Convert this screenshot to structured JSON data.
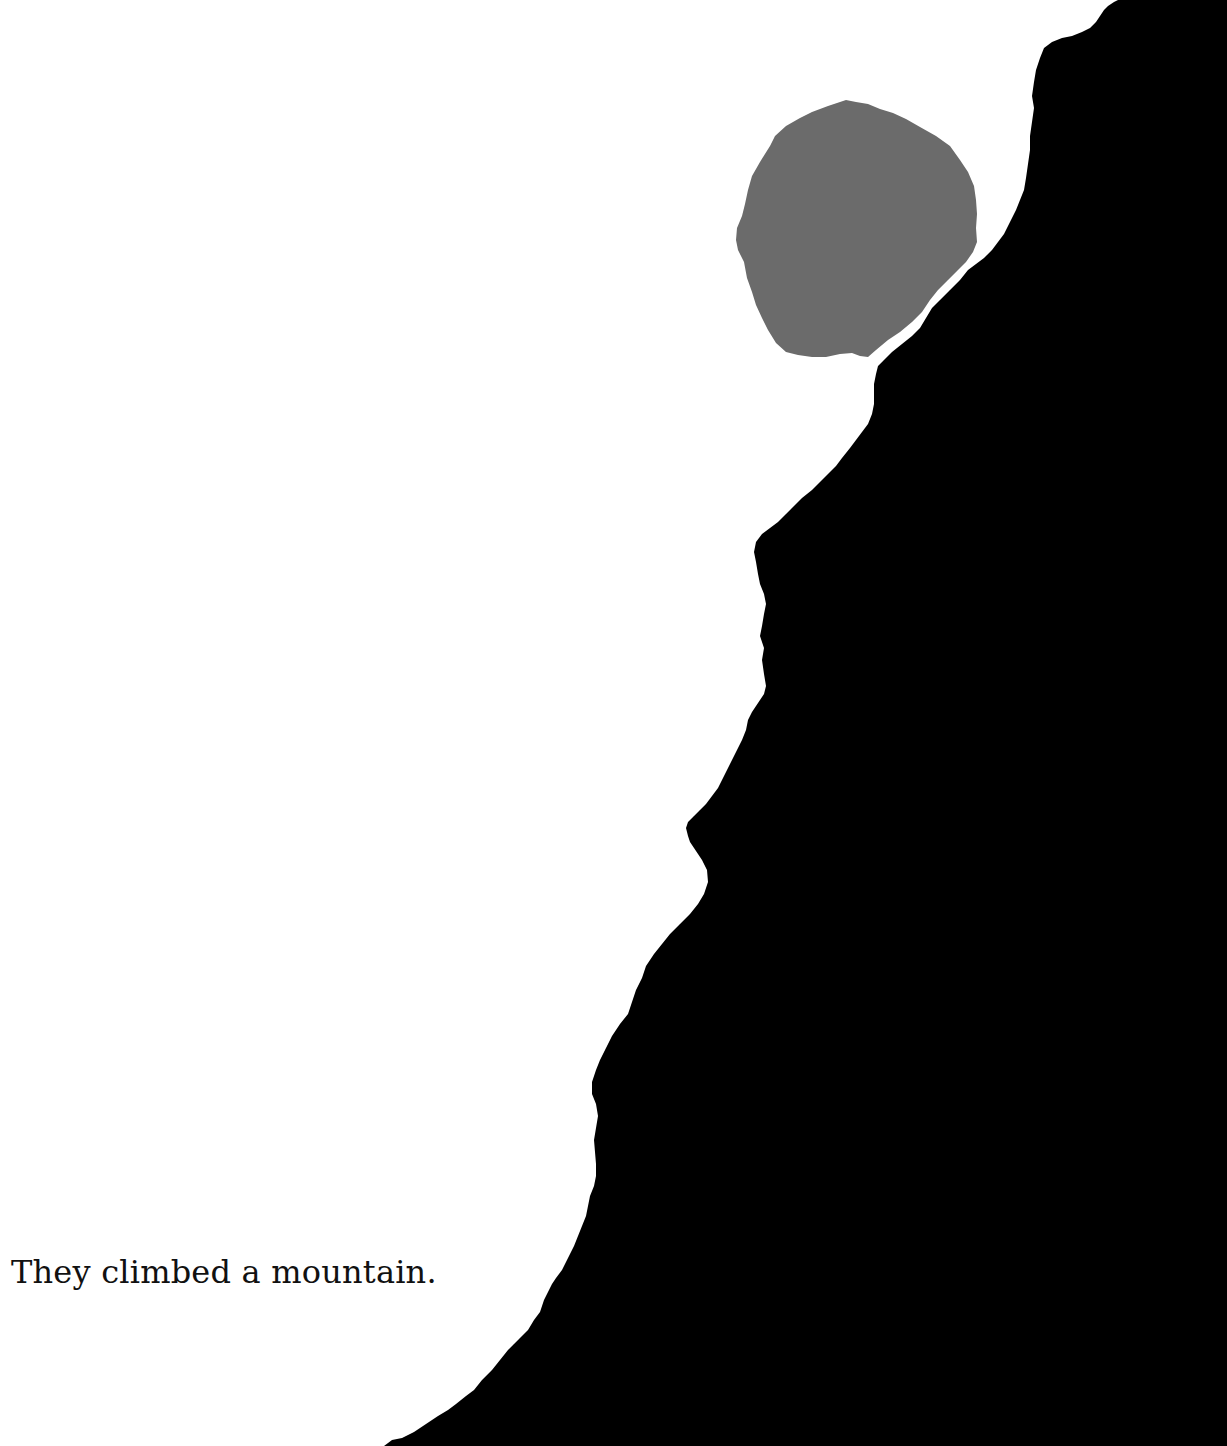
{
  "page": {
    "caption": "They climbed a mountain.",
    "background_color": "#ffffff"
  },
  "illustration": {
    "mountain": {
      "shape": "mountain-silhouette",
      "color": "#000000"
    },
    "moon": {
      "shape": "torn-paper-circle",
      "color": "#6b6b6b"
    },
    "profile_face": {
      "shape": "face-profile-in-cliff",
      "description": "nose and chin profile formed by cliff edge"
    }
  }
}
